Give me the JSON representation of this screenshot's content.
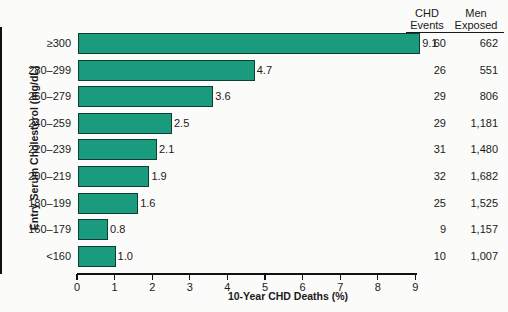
{
  "chart_data": {
    "type": "bar",
    "orientation": "horizontal",
    "title": "",
    "xlabel": "10-Year CHD Deaths (%)",
    "ylabel": "Entry Serum Cholesterol (mg/dL)",
    "xlim": [
      0,
      9.4
    ],
    "xticks": [
      0,
      1,
      2,
      3,
      4,
      5,
      6,
      7,
      8,
      9
    ],
    "xticklabels": [
      "0",
      "1",
      "2",
      "3",
      "4",
      "5",
      "6",
      "7",
      "8",
      "9"
    ],
    "grid": false,
    "legend": null,
    "bar_color": "#1a9b7d",
    "categories": [
      "≥300",
      "280–299",
      "260–279",
      "240–259",
      "220–239",
      "200–219",
      "180–199",
      "160–179",
      "<160"
    ],
    "values": [
      9.1,
      4.7,
      3.6,
      2.5,
      2.1,
      1.9,
      1.6,
      0.8,
      1.0
    ],
    "value_labels": [
      "9.1",
      "4.7",
      "3.6",
      "2.5",
      "2.1",
      "1.9",
      "1.6",
      "0.8",
      "1.0"
    ],
    "annotation_columns": [
      {
        "header_line1": "CHD",
        "header_line2": "Events",
        "values": [
          "60",
          "26",
          "29",
          "29",
          "31",
          "32",
          "25",
          "9",
          "10"
        ]
      },
      {
        "header_line1": "Men",
        "header_line2": "Exposed",
        "values": [
          "662",
          "551",
          "806",
          "1,181",
          "1,480",
          "1,682",
          "1,525",
          "1,157",
          "1,007"
        ]
      }
    ]
  },
  "rows": [
    {
      "category": "≥300",
      "value": 9.1,
      "label": "9.1",
      "chd_events": "60",
      "men_exposed": "662"
    },
    {
      "category": "280–299",
      "value": 4.7,
      "label": "4.7",
      "chd_events": "26",
      "men_exposed": "551"
    },
    {
      "category": "260–279",
      "value": 3.6,
      "label": "3.6",
      "chd_events": "29",
      "men_exposed": "806"
    },
    {
      "category": "240–259",
      "value": 2.5,
      "label": "2.5",
      "chd_events": "29",
      "men_exposed": "1,181"
    },
    {
      "category": "220–239",
      "value": 2.1,
      "label": "2.1",
      "chd_events": "31",
      "men_exposed": "1,480"
    },
    {
      "category": "200–219",
      "value": 1.9,
      "label": "1.9",
      "chd_events": "32",
      "men_exposed": "1,682"
    },
    {
      "category": "180–199",
      "value": 1.6,
      "label": "1.6",
      "chd_events": "25",
      "men_exposed": "1,525"
    },
    {
      "category": "160–179",
      "value": 0.8,
      "label": "0.8",
      "chd_events": "9",
      "men_exposed": "1,157"
    },
    {
      "category": "<160",
      "value": 1.0,
      "label": "1.0",
      "chd_events": "10",
      "men_exposed": "1,007"
    }
  ],
  "axes": {
    "xlabel": "10-Year CHD Deaths (%)",
    "ylabel": "Entry Serum Cholesterol (mg/dL)",
    "xticklabels": [
      "0",
      "1",
      "2",
      "3",
      "4",
      "5",
      "6",
      "7",
      "8",
      "9"
    ]
  },
  "table_headers": {
    "events_l1": "CHD",
    "events_l2": "Events",
    "exposed_l1": "Men",
    "exposed_l2": "Exposed"
  },
  "colors": {
    "bar": "#1a9b7d",
    "bar_edge": "#0d3f35",
    "axis": "#111111",
    "text": "#1a1a1a",
    "background": "#fbfbfa"
  }
}
